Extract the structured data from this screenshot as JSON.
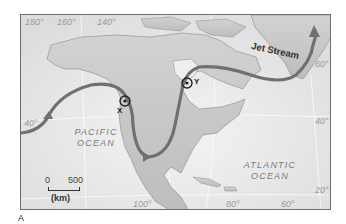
{
  "figure": {
    "label": "A",
    "map": {
      "region": "North America",
      "longitude_labels_top": [
        "180°",
        "160°",
        "140°"
      ],
      "longitude_labels_bottom": [
        "100°",
        "80°",
        "60°"
      ],
      "latitude_labels_left": [
        "40°"
      ],
      "latitude_labels_right": [
        "60°",
        "40°",
        "20°"
      ],
      "oceans": [
        {
          "name_line1": "PACIFIC",
          "name_line2": "OCEAN"
        },
        {
          "name_line1": "ATLANTIC",
          "name_line2": "OCEAN"
        }
      ],
      "feature_label": "Jet Stream",
      "markers": [
        {
          "id": "X",
          "label": "X"
        },
        {
          "id": "Y",
          "label": "Y"
        }
      ],
      "scale_bar": {
        "start": "0",
        "end": "500",
        "unit": "(km)"
      }
    }
  }
}
